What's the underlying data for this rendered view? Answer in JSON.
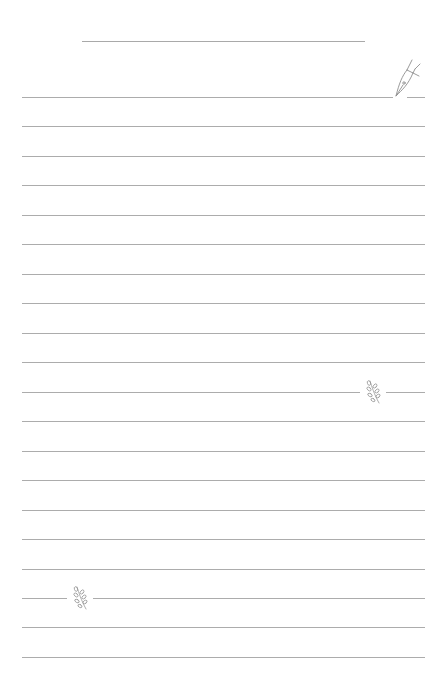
{
  "page": {
    "type": "lined-writing-paper",
    "background_color": "#ffffff",
    "line_color": "#acacac",
    "title_line": {
      "y": 41,
      "x_start": 82,
      "x_end": 365
    },
    "rules": {
      "count": 20,
      "first_y": 97,
      "spacing": 29.47,
      "x_start": 22,
      "x_end": 425
    }
  },
  "decorations": {
    "pen_nib": {
      "icon": "fountain-pen-nib-icon",
      "line_index": 0,
      "x": 393
    },
    "sprigs": [
      {
        "icon": "leaf-sprig-icon",
        "line_index": 10,
        "x": 364
      },
      {
        "icon": "leaf-sprig-icon",
        "line_index": 17,
        "x": 71
      }
    ]
  }
}
